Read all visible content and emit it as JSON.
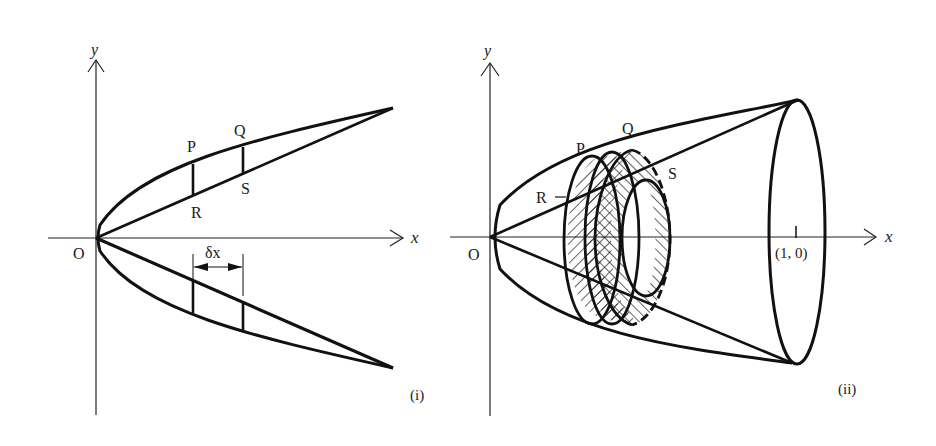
{
  "figure_i": {
    "caption": "(i)",
    "axis_x_label": "x",
    "axis_y_label": "y",
    "origin_label": "O",
    "points": {
      "P": "P",
      "Q": "Q",
      "R": "R",
      "S": "S"
    },
    "delta_label": "δx"
  },
  "figure_ii": {
    "caption": "(ii)",
    "axis_x_label": "x",
    "axis_y_label": "y",
    "origin_label": "O",
    "points": {
      "P": "P",
      "Q": "Q",
      "R": "R",
      "S": "S"
    },
    "tick_label": "(1, 0)"
  },
  "colors": {
    "ink": "#111111",
    "background": "#ffffff"
  }
}
